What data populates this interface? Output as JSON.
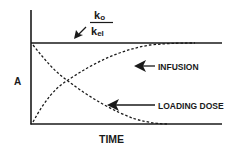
{
  "diagram": {
    "y_axis_label": "A",
    "x_axis_label": "TIME",
    "plateau_label": {
      "numerator": "k",
      "numerator_sub": "o",
      "denominator": "k",
      "denominator_sub": "el"
    },
    "curves": [
      {
        "name": "infusion",
        "label": "INFUSION",
        "style": "dashed",
        "shape": "rising to plateau"
      },
      {
        "name": "loading-dose",
        "label": "LOADING DOSE",
        "style": "dashed",
        "shape": "decaying from plateau"
      }
    ],
    "colors": {
      "ink": "#1a1a1a",
      "background": "#ffffff"
    }
  }
}
